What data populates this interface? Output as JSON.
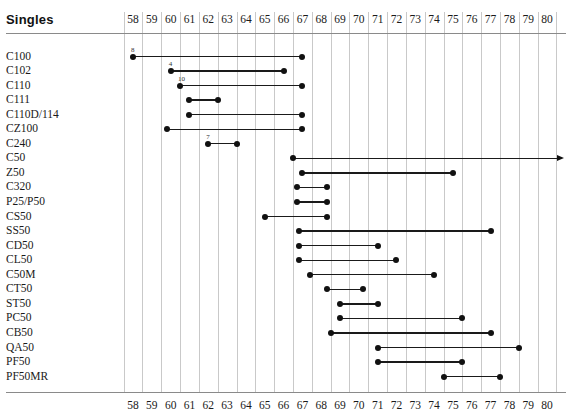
{
  "header": {
    "title": "Singles"
  },
  "axis": {
    "ticks": [
      "58",
      "59",
      "60",
      "61",
      "62",
      "63",
      "64",
      "65",
      "66",
      "67",
      "68",
      "69",
      "70",
      "71",
      "72",
      "73",
      "74",
      "75",
      "76",
      "77",
      "78",
      "79",
      "80"
    ],
    "min": 58,
    "max": 80,
    "show_top_labels": true,
    "show_bottom_labels": true
  },
  "colors": {
    "marker": "#111111",
    "line": "#1a1a1a",
    "grid": "#c9c9c9",
    "rule": "#8a8a8a",
    "text": "#1a1a1a",
    "background": "#ffffff"
  },
  "chart_data": {
    "type": "timeline",
    "title": "Singles",
    "xlabel": "",
    "ylabel": "",
    "xlim": [
      58,
      80
    ],
    "grid": true,
    "legend": "none",
    "x_ticks": [
      "58",
      "59",
      "60",
      "61",
      "62",
      "63",
      "64",
      "65",
      "66",
      "67",
      "68",
      "69",
      "70",
      "71",
      "72",
      "73",
      "74",
      "75",
      "76",
      "77",
      "78",
      "79",
      "80"
    ],
    "categories": [
      "C100",
      "C102",
      "C110",
      "C111",
      "C110D/114",
      "CZ100",
      "C240",
      "C50",
      "Z50",
      "C320",
      "P25/P50",
      "CS50",
      "SS50",
      "CD50",
      "CL50",
      "C50M",
      "CT50",
      "ST50",
      "PC50",
      "CB50",
      "QA50",
      "PF50",
      "PF50MR"
    ],
    "rows": [
      {
        "label": "C100",
        "start": 58.0,
        "end": 67.0,
        "note": "8",
        "open_end": false
      },
      {
        "label": "C102",
        "start": 60.0,
        "end": 66.0,
        "note": "4",
        "open_end": false
      },
      {
        "label": "C110",
        "start": 60.5,
        "end": 67.0,
        "note": "10",
        "open_end": false
      },
      {
        "label": "C111",
        "start": 61.0,
        "end": 62.5,
        "note": "",
        "open_end": false
      },
      {
        "label": "C110D/114",
        "start": 61.0,
        "end": 67.0,
        "note": "",
        "open_end": false
      },
      {
        "label": "CZ100",
        "start": 59.8,
        "end": 67.0,
        "note": "",
        "open_end": false
      },
      {
        "label": "C240",
        "start": 62.0,
        "end": 63.5,
        "note": "7",
        "open_end": false
      },
      {
        "label": "C50",
        "start": 66.5,
        "end": 80.6,
        "note": "",
        "open_end": true
      },
      {
        "label": "Z50",
        "start": 67.0,
        "end": 75.0,
        "note": "",
        "open_end": false
      },
      {
        "label": "C320",
        "start": 66.7,
        "end": 68.3,
        "note": "",
        "open_end": false
      },
      {
        "label": "P25/P50",
        "start": 66.7,
        "end": 68.3,
        "note": "",
        "open_end": false
      },
      {
        "label": "CS50",
        "start": 65.0,
        "end": 68.3,
        "note": "",
        "open_end": false
      },
      {
        "label": "SS50",
        "start": 66.8,
        "end": 77.0,
        "note": "",
        "open_end": false
      },
      {
        "label": "CD50",
        "start": 66.8,
        "end": 71.0,
        "note": "",
        "open_end": false
      },
      {
        "label": "CL50",
        "start": 66.8,
        "end": 72.0,
        "note": "",
        "open_end": false
      },
      {
        "label": "C50M",
        "start": 67.4,
        "end": 74.0,
        "note": "",
        "open_end": false
      },
      {
        "label": "CT50",
        "start": 68.3,
        "end": 70.2,
        "note": "",
        "open_end": false
      },
      {
        "label": "ST50",
        "start": 69.0,
        "end": 71.0,
        "note": "",
        "open_end": false
      },
      {
        "label": "PC50",
        "start": 69.0,
        "end": 75.5,
        "note": "",
        "open_end": false
      },
      {
        "label": "CB50",
        "start": 68.5,
        "end": 77.0,
        "note": "",
        "open_end": false
      },
      {
        "label": "QA50",
        "start": 71.0,
        "end": 78.5,
        "note": "",
        "open_end": false
      },
      {
        "label": "PF50",
        "start": 71.0,
        "end": 75.5,
        "note": "",
        "open_end": false
      },
      {
        "label": "PF50MR",
        "start": 74.5,
        "end": 77.5,
        "note": "",
        "open_end": false
      }
    ]
  }
}
